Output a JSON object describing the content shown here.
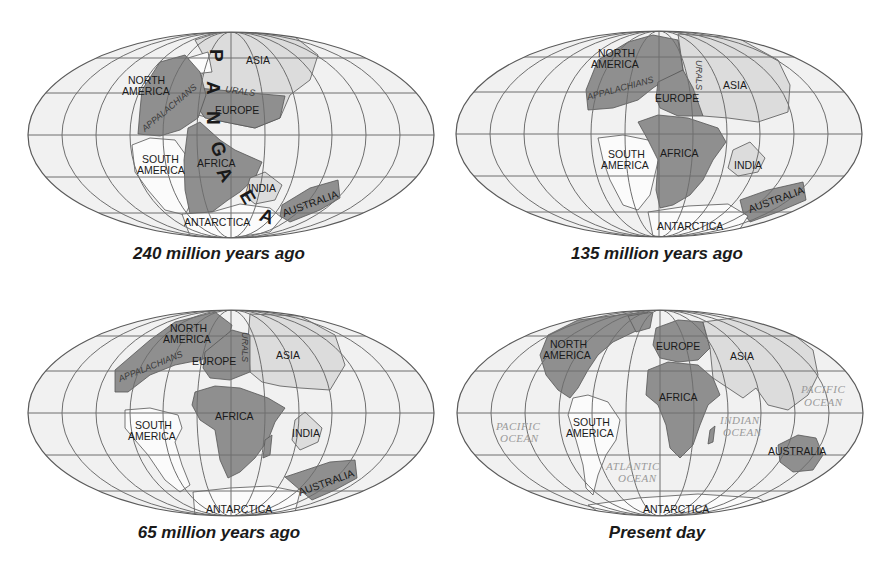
{
  "figure": {
    "colors": {
      "ocean": "#f1f1f1",
      "grid": "#6e6e6e",
      "dark_land": "#8f8f8f",
      "light_land": "#dcdcdc",
      "white_land": "#fbfbfb",
      "coast": "#555555",
      "ocean_label": "#9a9a9a"
    },
    "panels": [
      {
        "id": "240mya",
        "caption": "240 million years ago",
        "labels": {
          "north_america": [
            "NORTH",
            "AMERICA"
          ],
          "asia": "ASIA",
          "europe": "EUROPE",
          "urals": "URALS",
          "appalachians": "APPALACHIANS",
          "south_america": [
            "SOUTH",
            "AMERICA"
          ],
          "africa": "AFRICA",
          "india": "INDIA",
          "australia": "AUSTRALIA",
          "antarctica": "ANTARCTICA",
          "supercontinent_letters": [
            "P",
            "A",
            "N",
            "G",
            "A",
            "E",
            "A"
          ]
        }
      },
      {
        "id": "135mya",
        "caption": "135 million years ago",
        "labels": {
          "north_america": [
            "NORTH",
            "AMERICA"
          ],
          "appalachians": "APPALACHIANS",
          "urals": "URALS",
          "europe": "EUROPE",
          "asia": "ASIA",
          "south_america": [
            "SOUTH",
            "AMERICA"
          ],
          "africa": "AFRICA",
          "india": "INDIA",
          "australia": "AUSTRALIA",
          "antarctica": "ANTARCTICA"
        }
      },
      {
        "id": "65mya",
        "caption": "65 million years ago",
        "labels": {
          "north_america": [
            "NORTH",
            "AMERICA"
          ],
          "appalachians": "APPALACHIANS",
          "europe": "EUROPE",
          "urals": "URALS",
          "asia": "ASIA",
          "south_america": [
            "SOUTH",
            "AMERICA"
          ],
          "africa": "AFRICA",
          "india": "INDIA",
          "australia": "AUSTRALIA",
          "antarctica": "ANTARCTICA"
        }
      },
      {
        "id": "present",
        "caption": "Present day",
        "labels": {
          "north_america": [
            "NORTH",
            "AMERICA"
          ],
          "europe": "EUROPE",
          "asia": "ASIA",
          "africa": "AFRICA",
          "south_america": [
            "SOUTH",
            "AMERICA"
          ],
          "australia": "AUSTRALIA",
          "antarctica": "ANTARCTICA",
          "pacific_ocean_west": [
            "PACIFIC",
            "OCEAN"
          ],
          "pacific_ocean_east": [
            "PACIFIC",
            "OCEAN"
          ],
          "atlantic_ocean": [
            "ATLANTIC",
            "OCEAN"
          ],
          "indian_ocean": [
            "INDIAN",
            "OCEAN"
          ]
        }
      }
    ]
  }
}
